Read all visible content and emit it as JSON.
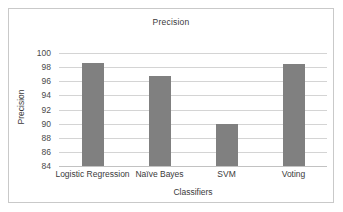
{
  "chart_data": {
    "type": "bar",
    "title": "Precision",
    "xlabel": "Classifiers",
    "ylabel": "Precision",
    "categories": [
      "Logistic Regression",
      "Naïve Bayes",
      "SVM",
      "Voting"
    ],
    "values": [
      98.6,
      96.8,
      90.0,
      98.45
    ],
    "ylim": [
      84,
      100
    ],
    "ytick_values": [
      84,
      86,
      88,
      90,
      92,
      94,
      96,
      98,
      100
    ],
    "ytick_labels": [
      "84",
      "86",
      "88",
      "90",
      "92",
      "94",
      "96",
      "98",
      "100"
    ],
    "grid": true,
    "legend": false,
    "series": [
      {
        "name": "Precision",
        "values": [
          98.6,
          96.8,
          90.0,
          98.45
        ]
      }
    ]
  },
  "style": {
    "bar_color": "#808080",
    "grid_color": "#d4d4d4",
    "axis_color": "#c2c2c2",
    "border_color": "#c9c9c9",
    "text_color": "#3a3a3a",
    "background": "#ffffff"
  }
}
